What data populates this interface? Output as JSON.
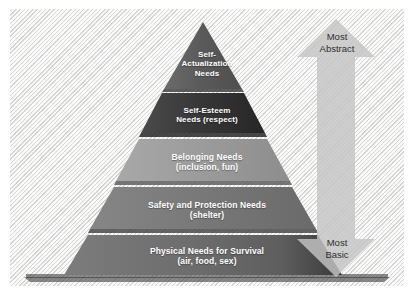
{
  "diagram": {
    "background_color": "#e9e9e7",
    "text_color": "#ffffff",
    "label_color": "#2e2e2e"
  },
  "pyramid": {
    "tiers": [
      {
        "id": "self-actualization",
        "line1": "Self-",
        "line2": "Actualization",
        "line3": "Needs",
        "color": "#5f5f5f",
        "rank": 5
      },
      {
        "id": "self-esteem",
        "line1": "Self-Esteem",
        "line2": "Needs (respect)",
        "line3": "",
        "color": "#3c3c3c",
        "rank": 4
      },
      {
        "id": "belonging",
        "line1": "Belonging Needs",
        "line2": "(inclusion, fun)",
        "line3": "",
        "color": "#9a9a9a",
        "rank": 3
      },
      {
        "id": "safety-protection",
        "line1": "Safety and Protection Needs",
        "line2": "(shelter)",
        "line3": "",
        "color": "#797979",
        "rank": 2
      },
      {
        "id": "physical-survival",
        "line1": "Physical Needs for Survival",
        "line2": "(air, food, sex)",
        "line3": "",
        "color": "#6e6e6e",
        "rank": 1
      }
    ]
  },
  "arrow": {
    "icon": "double-headed-vertical-arrow",
    "color": "#c9c9c9",
    "top_label_line1": "Most",
    "top_label_line2": "Abstract",
    "bottom_label_line1": "Most",
    "bottom_label_line2": "Basic"
  }
}
